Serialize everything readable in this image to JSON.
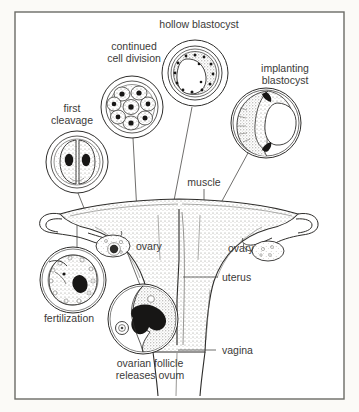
{
  "figure": {
    "border_color": "#6b6b66",
    "background_color": "#fbfaf7",
    "ink_color": "#2e2d2b",
    "label_color": "#3b3a38",
    "stipple_color": "#8d8b86"
  },
  "labels": {
    "hollow_blastocyst": "hollow blastocyst",
    "continued_cell_division_line1": "continued",
    "continued_cell_division_line2": "cell division",
    "implanting_blastocyst_line1": "implanting",
    "implanting_blastocyst_line2": "blastocyst",
    "first_cleavage_line1": "first",
    "first_cleavage_line2": "cleavage",
    "muscle": "muscle",
    "ovary_left": "ovary",
    "ovary_right": "ovary",
    "uterus": "uterus",
    "vagina": "vagina",
    "fertilization": "fertilization",
    "ovarian_follicle_line1": "ovarian follicle",
    "ovarian_follicle_line2": "releases ovum"
  },
  "insets": [
    {
      "name": "first-cleavage",
      "cx": 77,
      "cy": 162,
      "r": 31,
      "cells": 2,
      "description": "two-cell stage embryo inside zona pellucida"
    },
    {
      "name": "continued-cell-division",
      "cx": 132,
      "cy": 107,
      "r": 31,
      "cells": 9,
      "description": "morula, many cells dividing inside zona pellucida"
    },
    {
      "name": "hollow-blastocyst",
      "cx": 195,
      "cy": 73,
      "r": 33,
      "cells": 24,
      "description": "blastocyst with fluid-filled cavity and ring of cells"
    },
    {
      "name": "implanting-blastocyst",
      "cx": 266,
      "cy": 123,
      "r": 35,
      "cells": 0,
      "description": "blastocyst embedded in uterine wall, crescent trophoblast"
    },
    {
      "name": "fertilization",
      "cx": 73,
      "cy": 280,
      "r": 33,
      "cells": 1,
      "description": "sperm entering ovum, large dark nucleus"
    },
    {
      "name": "ovarian-follicle",
      "cx": 143,
      "cy": 319,
      "r": 35,
      "cells": 1,
      "description": "follicle rupturing and releasing ovum"
    }
  ],
  "anatomy": {
    "parts": [
      "fallopian tube left",
      "fallopian tube right",
      "ovary left",
      "ovary right",
      "uterus body",
      "uterine muscle wall",
      "cervix",
      "vagina"
    ]
  }
}
